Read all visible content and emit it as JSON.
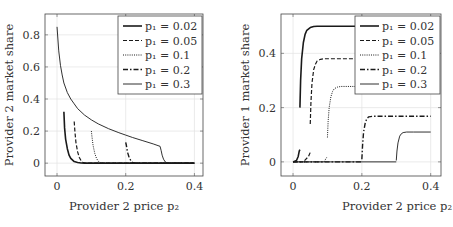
{
  "chart_data": [
    {
      "type": "line",
      "title": "",
      "xlabel": "Provider 2 price p₂",
      "ylabel": "Provider 2 market share",
      "xlim": [
        -0.035,
        0.425
      ],
      "ylim": [
        -0.08,
        0.93
      ],
      "xticks": [
        0,
        0.2,
        0.4
      ],
      "xtick_labels": [
        "0",
        "0.2",
        "0.4"
      ],
      "yticks": [
        0,
        0.2,
        0.4,
        0.6,
        0.8
      ],
      "ytick_labels": [
        "0",
        "0.2",
        "0.4",
        "0.6",
        "0.8"
      ],
      "grid": true,
      "legend_position": "top-right",
      "series": [
        {
          "name": "p₁ = 0.02",
          "p1": 0.02,
          "style": "solid-thick",
          "x": [
            0.02,
            0.022,
            0.025,
            0.03,
            0.035,
            0.04,
            0.05,
            0.06,
            0.07,
            0.08,
            0.1,
            0.2,
            0.3,
            0.4
          ],
          "y": [
            0.32,
            0.22,
            0.15,
            0.09,
            0.05,
            0.03,
            0.01,
            0.004,
            0.001,
            0,
            0,
            0,
            0,
            0
          ]
        },
        {
          "name": "p₁ = 0.05",
          "p1": 0.05,
          "style": "dashed",
          "x": [
            0.05,
            0.052,
            0.055,
            0.06,
            0.065,
            0.07,
            0.075,
            0.08,
            0.09,
            0.1,
            0.2,
            0.4
          ],
          "y": [
            0.26,
            0.2,
            0.13,
            0.07,
            0.035,
            0.015,
            0.006,
            0.002,
            0,
            0,
            0,
            0
          ]
        },
        {
          "name": "p₁ = 0.1",
          "p1": 0.1,
          "style": "dotted",
          "x": [
            0.1,
            0.102,
            0.105,
            0.11,
            0.115,
            0.12,
            0.125,
            0.13,
            0.14,
            0.2,
            0.4
          ],
          "y": [
            0.2,
            0.16,
            0.11,
            0.06,
            0.03,
            0.012,
            0.004,
            0.001,
            0,
            0,
            0
          ]
        },
        {
          "name": "p₁ = 0.2",
          "p1": 0.2,
          "style": "dash-dot",
          "x": [
            0.2,
            0.202,
            0.205,
            0.21,
            0.215,
            0.22,
            0.23,
            0.24,
            0.3,
            0.4
          ],
          "y": [
            0.13,
            0.11,
            0.07,
            0.035,
            0.015,
            0.005,
            0,
            0,
            0,
            0
          ]
        },
        {
          "name": "p₁ = 0.3",
          "p1": 0.3,
          "style": "solid-thin",
          "x": [
            0,
            0.005,
            0.01,
            0.015,
            0.02,
            0.03,
            0.04,
            0.05,
            0.06,
            0.08,
            0.1,
            0.12,
            0.15,
            0.18,
            0.2,
            0.22,
            0.25,
            0.28,
            0.3,
            0.303,
            0.306,
            0.31,
            0.315,
            0.32,
            0.33,
            0.4
          ],
          "y": [
            0.85,
            0.7,
            0.61,
            0.55,
            0.5,
            0.44,
            0.4,
            0.37,
            0.34,
            0.3,
            0.27,
            0.245,
            0.215,
            0.19,
            0.175,
            0.16,
            0.14,
            0.12,
            0.105,
            0.08,
            0.05,
            0.025,
            0.008,
            0.002,
            0,
            0
          ]
        }
      ]
    },
    {
      "type": "line",
      "title": "",
      "xlabel": "Provider 2 price p₂",
      "ylabel": "Provider 1 market share",
      "xlim": [
        -0.035,
        0.43
      ],
      "ylim": [
        -0.052,
        0.545
      ],
      "xticks": [
        0,
        0.2,
        0.4
      ],
      "xtick_labels": [
        "0",
        "0.2",
        "0.4"
      ],
      "yticks": [
        0,
        0.2,
        0.4
      ],
      "ytick_labels": [
        "0",
        "0.2",
        "0.4"
      ],
      "grid": true,
      "legend_position": "top-right",
      "series": [
        {
          "name": "p₁ = 0.02",
          "p1": 0.02,
          "style": "solid-thick",
          "segments": [
            {
              "x": [
                0,
                0.01,
                0.015,
                0.018,
                0.02
              ],
              "y": [
                0,
                0.005,
                0.02,
                0.04,
                0.045
              ]
            },
            {
              "x": [
                0.02,
                0.022,
                0.025,
                0.03,
                0.035,
                0.04,
                0.05,
                0.06,
                0.07,
                0.09,
                0.2,
                0.4
              ],
              "y": [
                0.2,
                0.3,
                0.38,
                0.44,
                0.47,
                0.485,
                0.495,
                0.499,
                0.5,
                0.5,
                0.5,
                0.5
              ]
            }
          ]
        },
        {
          "name": "p₁ = 0.05",
          "p1": 0.05,
          "style": "dashed",
          "segments": [
            {
              "x": [
                0,
                0.03,
                0.045,
                0.05
              ],
              "y": [
                0,
                0,
                0.02,
                0.035
              ]
            },
            {
              "x": [
                0.05,
                0.052,
                0.055,
                0.06,
                0.065,
                0.07,
                0.08,
                0.09,
                0.1,
                0.2,
                0.4
              ],
              "y": [
                0.14,
                0.22,
                0.29,
                0.34,
                0.36,
                0.372,
                0.378,
                0.38,
                0.38,
                0.38,
                0.38
              ]
            }
          ]
        },
        {
          "name": "p₁ = 0.1",
          "p1": 0.1,
          "style": "dotted",
          "segments": [
            {
              "x": [
                0,
                0.09,
                0.097,
                0.1
              ],
              "y": [
                0,
                0,
                0.015,
                0.02
              ]
            },
            {
              "x": [
                0.1,
                0.102,
                0.105,
                0.11,
                0.115,
                0.12,
                0.13,
                0.14,
                0.2,
                0.4
              ],
              "y": [
                0.09,
                0.15,
                0.2,
                0.24,
                0.26,
                0.27,
                0.276,
                0.278,
                0.278,
                0.278
              ]
            }
          ]
        },
        {
          "name": "p₁ = 0.2",
          "p1": 0.2,
          "style": "dash-dot",
          "segments": [
            {
              "x": [
                0,
                0.2
              ],
              "y": [
                0,
                0
              ]
            },
            {
              "x": [
                0.2,
                0.202,
                0.205,
                0.21,
                0.215,
                0.22,
                0.23,
                0.25,
                0.3,
                0.4
              ],
              "y": [
                0.01,
                0.06,
                0.11,
                0.145,
                0.16,
                0.166,
                0.168,
                0.168,
                0.168,
                0.168
              ]
            }
          ]
        },
        {
          "name": "p₁ = 0.3",
          "p1": 0.3,
          "style": "solid-thin",
          "segments": [
            {
              "x": [
                0,
                0.3
              ],
              "y": [
                0,
                0
              ]
            },
            {
              "x": [
                0.3,
                0.302,
                0.305,
                0.31,
                0.315,
                0.32,
                0.33,
                0.35,
                0.4
              ],
              "y": [
                0.005,
                0.04,
                0.07,
                0.095,
                0.104,
                0.108,
                0.11,
                0.11,
                0.11
              ]
            }
          ]
        }
      ]
    }
  ]
}
